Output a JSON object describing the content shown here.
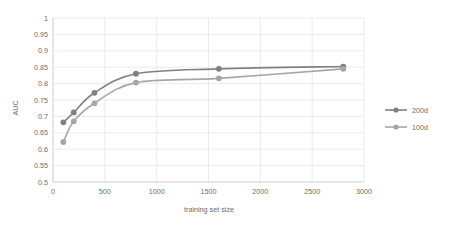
{
  "chart_data": {
    "type": "line",
    "title": "",
    "xlabel": "training set size",
    "ylabel": "AUC",
    "x": [
      100,
      200,
      400,
      800,
      1600,
      2800
    ],
    "series": [
      {
        "name": "200d",
        "color": "#808080",
        "values": [
          0.682,
          0.712,
          0.772,
          0.83,
          0.845,
          0.852
        ]
      },
      {
        "name": "100d",
        "color": "#a6a6a6",
        "values": [
          0.622,
          0.685,
          0.74,
          0.803,
          0.816,
          0.845
        ]
      }
    ],
    "xlim": [
      0,
      3000
    ],
    "ylim": [
      0.5,
      1.0
    ],
    "xticks": [
      0,
      500,
      1000,
      1500,
      2000,
      2500,
      3000
    ],
    "xtick_labels": [
      "0",
      "500",
      "1000",
      "1500",
      "2000",
      "2500",
      "3000"
    ],
    "yticks": [
      0.5,
      0.55,
      0.6,
      0.65,
      0.7,
      0.75,
      0.8,
      0.85,
      0.9,
      0.95,
      1.0
    ],
    "ytick_labels": [
      "0.5",
      "0.55",
      "0.6",
      "0.65",
      "0.7",
      "0.75",
      "0.8",
      "0.85",
      "0.9",
      "0.95",
      "1"
    ],
    "grid": {
      "horizontal": true,
      "vertical": true,
      "color": "#e3e3e3"
    },
    "legend": {
      "position": "right",
      "entries": [
        {
          "label": "200d",
          "color": "#808080"
        },
        {
          "label": "100d",
          "color": "#a6a6a6"
        }
      ]
    },
    "marker": "circle",
    "background": "#ffffff"
  }
}
